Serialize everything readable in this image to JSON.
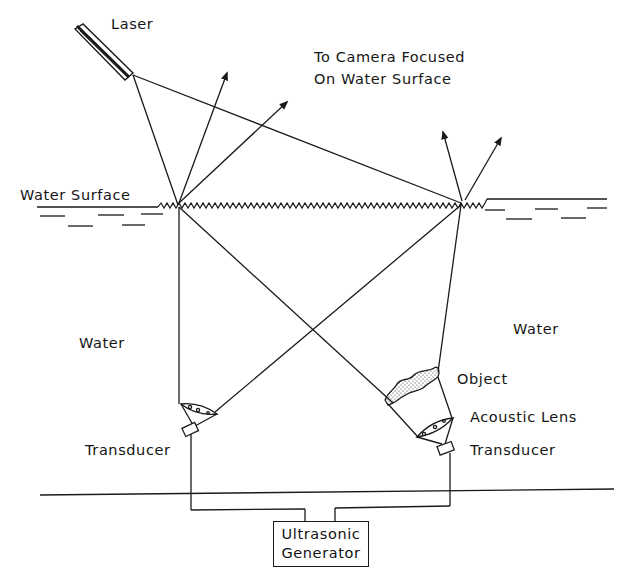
{
  "diagram": {
    "type": "schematic",
    "labels": {
      "laser": "Laser",
      "camera_line1": "To Camera Focused",
      "camera_line2": "On Water Surface",
      "water_surface": "Water Surface",
      "water_left": "Water",
      "water_right": "Water",
      "object": "Object",
      "acoustic_lens": "Acoustic Lens",
      "transducer_left": "Transducer",
      "transducer_right": "Transducer",
      "generator_line1": "Ultrasonic",
      "generator_line2": "Generator"
    },
    "colors": {
      "line": "#1a1a1a",
      "background": "#ffffff"
    }
  }
}
